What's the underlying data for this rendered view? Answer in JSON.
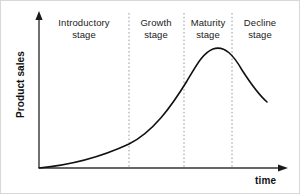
{
  "diagram": {
    "type": "product-life-cycle-curve",
    "background_color": "#ffffff",
    "axes": {
      "y_label": "Product sales",
      "x_label": "time",
      "axis_color": "#333333",
      "origin": {
        "x": 38,
        "y": 167
      },
      "y_top": {
        "x": 38,
        "y": 12
      },
      "x_right": {
        "x": 286,
        "y": 167
      }
    },
    "curve": {
      "color": "#111111",
      "stroke_width": 1.6,
      "path": "M 38 167 C 70 164, 100 156, 128 143 C 152 131, 170 106, 186 80 C 196 63, 202 52, 212 48 C 224 44, 233 55, 241 69 C 250 83, 258 94, 266 101"
    },
    "dividers": {
      "color": "#9a9a9a",
      "dash": "1.6 2.2",
      "x_positions": [
        128,
        183,
        231
      ],
      "y_top": 12,
      "y_bottom": 167
    },
    "stages": [
      {
        "name": "introductory",
        "line1": "Introductory",
        "line2": "stage",
        "center_x": 83,
        "top": 16
      },
      {
        "name": "growth",
        "line1": "Growth",
        "line2": "stage",
        "center_x": 155,
        "top": 16
      },
      {
        "name": "maturity",
        "line1": "Maturity",
        "line2": "stage",
        "center_x": 207,
        "top": 16
      },
      {
        "name": "decline",
        "line1": "Decline",
        "line2": "stage",
        "center_x": 259,
        "top": 16
      }
    ]
  },
  "chart_data": {
    "type": "line",
    "title": "",
    "xlabel": "time",
    "ylabel": "Product sales",
    "grid": false,
    "legend": null,
    "xlim": [
      0,
      100
    ],
    "ylim": [
      0,
      100
    ],
    "annotations": [
      "Introductory stage",
      "Growth stage",
      "Maturity stage",
      "Decline stage"
    ],
    "stage_boundaries_pct": [
      36,
      58,
      78
    ],
    "x": [
      0,
      10,
      20,
      30,
      36,
      45,
      52,
      58,
      65,
      70,
      78,
      85,
      92,
      100
    ],
    "values": [
      0,
      3,
      7,
      13,
      18,
      32,
      48,
      62,
      77,
      83,
      80,
      70,
      56,
      46
    ]
  }
}
